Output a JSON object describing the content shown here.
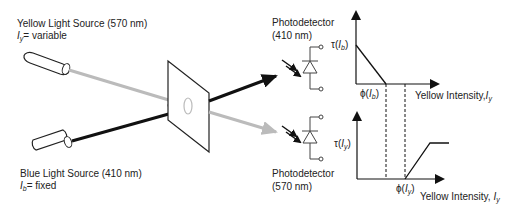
{
  "yellow_source": {
    "title": "Yellow Light Source (570 nm)",
    "var_symbol": "I",
    "var_subscript": "y",
    "var_value": "= variable",
    "color": "#b8b8b8"
  },
  "blue_source": {
    "title": "Blue Light Source (410 nm)",
    "var_symbol": "I",
    "var_subscript": "b",
    "var_value": "= fixed",
    "color": "#111111"
  },
  "detector_top": {
    "title_line1": "Photodetector",
    "title_line2": "(410 nm)"
  },
  "detector_bottom": {
    "title_line1": "Photodetector",
    "title_line2": "(570 nm)"
  },
  "chart_top": {
    "y_label_prefix": "τ(",
    "y_label_var": "I",
    "y_label_sub": "b",
    "y_label_suffix": ")",
    "threshold_prefix": "ϕ(",
    "threshold_var": "I",
    "threshold_sub": "b",
    "threshold_suffix": ")",
    "x_label": "Yellow Intensity,",
    "x_label_var": "I",
    "x_label_sub": "y"
  },
  "chart_bottom": {
    "y_label_prefix": "τ(",
    "y_label_var": "I",
    "y_label_sub": "y",
    "y_label_suffix": ")",
    "threshold_prefix": "ϕ(",
    "threshold_var": "I",
    "threshold_sub": "y",
    "threshold_suffix": ")",
    "x_label": "Yellow Intensity,",
    "x_label_var": "I",
    "x_label_sub": "y"
  }
}
